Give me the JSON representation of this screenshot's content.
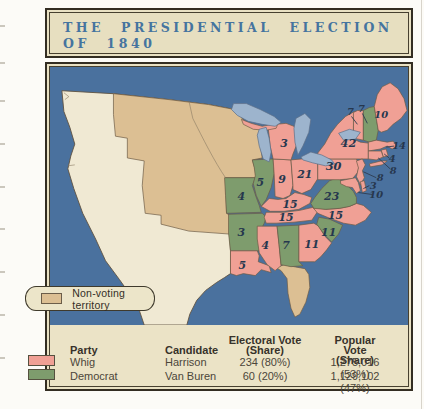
{
  "title": {
    "line1": "THE PRESIDENTIAL ELECTION",
    "line2": "OF 1840"
  },
  "legend": {
    "label": "Non-voting territory"
  },
  "parties": {
    "whig": {
      "name": "Whig",
      "color": "#f0a095",
      "candidate": "Harrison"
    },
    "democrat": {
      "name": "Democrat",
      "color": "#7e9c6d",
      "candidate": "Van Buren"
    }
  },
  "map": {
    "colors": {
      "ocean": "#4a719e",
      "territory": "#dcbf93",
      "foreign": "#f0e9d3",
      "lake": "#9db4cd",
      "border": "#6d5c46"
    },
    "states": [
      {
        "id": "me",
        "name": "Maine",
        "votes": 10,
        "party": "whig"
      },
      {
        "id": "nh",
        "name": "New Hampshire",
        "votes": 7,
        "party": "democrat"
      },
      {
        "id": "vt",
        "name": "Vermont",
        "votes": 7,
        "party": "whig"
      },
      {
        "id": "ma",
        "name": "Massachusetts",
        "votes": 14,
        "party": "whig"
      },
      {
        "id": "ri",
        "name": "Rhode Island",
        "votes": 4,
        "party": "whig"
      },
      {
        "id": "ct",
        "name": "Connecticut",
        "votes": 8,
        "party": "whig"
      },
      {
        "id": "ny",
        "name": "New York",
        "votes": 42,
        "party": "whig"
      },
      {
        "id": "nj",
        "name": "New Jersey",
        "votes": 8,
        "party": "whig"
      },
      {
        "id": "pa",
        "name": "Pennsylvania",
        "votes": 30,
        "party": "whig"
      },
      {
        "id": "de",
        "name": "Delaware",
        "votes": 3,
        "party": "whig"
      },
      {
        "id": "md",
        "name": "Maryland",
        "votes": 10,
        "party": "whig"
      },
      {
        "id": "va",
        "name": "Virginia",
        "votes": 23,
        "party": "democrat"
      },
      {
        "id": "nc",
        "name": "North Carolina",
        "votes": 15,
        "party": "whig"
      },
      {
        "id": "sc",
        "name": "South Carolina",
        "votes": 11,
        "party": "democrat"
      },
      {
        "id": "ga",
        "name": "Georgia",
        "votes": 11,
        "party": "whig"
      },
      {
        "id": "al",
        "name": "Alabama",
        "votes": 7,
        "party": "democrat"
      },
      {
        "id": "ms",
        "name": "Mississippi",
        "votes": 4,
        "party": "whig"
      },
      {
        "id": "la",
        "name": "Louisiana",
        "votes": 5,
        "party": "whig"
      },
      {
        "id": "ar",
        "name": "Arkansas",
        "votes": 3,
        "party": "democrat"
      },
      {
        "id": "tn",
        "name": "Tennessee",
        "votes": 15,
        "party": "whig"
      },
      {
        "id": "ky",
        "name": "Kentucky",
        "votes": 15,
        "party": "whig"
      },
      {
        "id": "oh",
        "name": "Ohio",
        "votes": 21,
        "party": "whig"
      },
      {
        "id": "in",
        "name": "Indiana",
        "votes": 9,
        "party": "whig"
      },
      {
        "id": "il",
        "name": "Illinois",
        "votes": 5,
        "party": "democrat"
      },
      {
        "id": "mi",
        "name": "Michigan",
        "votes": 3,
        "party": "whig"
      },
      {
        "id": "mo",
        "name": "Missouri",
        "votes": 4,
        "party": "democrat"
      }
    ]
  },
  "table": {
    "headers": {
      "party": "Party",
      "candidate": "Candidate",
      "electoral_l1": "Electoral Vote",
      "electoral_l2": "(Share)",
      "popular_l1": "Popular Vote",
      "popular_l2": "(Share)"
    },
    "rows": [
      {
        "party_key": "whig",
        "party": "Whig",
        "candidate": "Harrison",
        "electoral": "234 (80%)",
        "popular": "1,275,016 (53%)"
      },
      {
        "party_key": "democrat",
        "party": "Democrat",
        "candidate": "Van Buren",
        "electoral": "60 (20%)",
        "popular": "1,129,102 (47%)"
      }
    ]
  }
}
